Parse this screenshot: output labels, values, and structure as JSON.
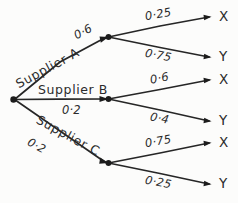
{
  "diagram": {
    "type": "probability-tree",
    "background_color": "#fcfcfb",
    "stroke_color": "#262626",
    "text_color": "#2b2b2b"
  },
  "root": {
    "label": ""
  },
  "branches": [
    {
      "name": "Supplier A",
      "probability": "0·6",
      "outcomes": [
        {
          "label": "X",
          "probability": "0·25"
        },
        {
          "label": "Y",
          "probability": "0·75"
        }
      ]
    },
    {
      "name": "Supplier B",
      "probability": "0·2",
      "outcomes": [
        {
          "label": "X",
          "probability": "0·6"
        },
        {
          "label": "Y",
          "probability": "0·4"
        }
      ]
    },
    {
      "name": "Supplier C",
      "probability": "0·2",
      "outcomes": [
        {
          "label": "X",
          "probability": "0·75"
        },
        {
          "label": "Y",
          "probability": "0·25"
        }
      ]
    }
  ]
}
